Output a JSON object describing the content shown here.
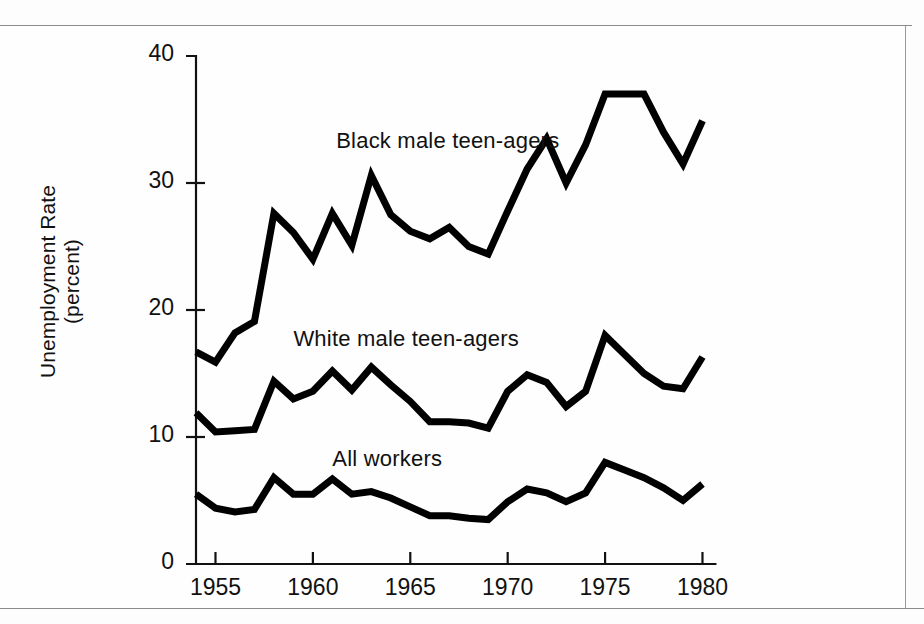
{
  "figure": {
    "ylabel_line1": "Unemployment Rate",
    "ylabel_line2": "(percent)"
  },
  "chart_data": {
    "type": "line",
    "title": "",
    "xlabel": "",
    "ylabel": "Unemployment Rate (percent)",
    "xlim": [
      1954,
      1980
    ],
    "ylim": [
      0,
      40
    ],
    "xticks": [
      1955,
      1960,
      1965,
      1970,
      1975,
      1980
    ],
    "yticks": [
      0,
      10,
      20,
      30,
      40
    ],
    "grid": false,
    "legend": "inline-annotations",
    "x": [
      1954,
      1955,
      1956,
      1957,
      1958,
      1959,
      1960,
      1961,
      1962,
      1963,
      1964,
      1965,
      1966,
      1967,
      1968,
      1969,
      1970,
      1971,
      1972,
      1973,
      1974,
      1975,
      1976,
      1977,
      1978,
      1979,
      1980
    ],
    "series": [
      {
        "name": "Black male teen-agers",
        "label_x": 1961.2,
        "label_y": 33.2,
        "values": [
          16.7,
          15.9,
          18.2,
          19.1,
          27.6,
          26.1,
          24.0,
          27.6,
          25.1,
          30.6,
          27.5,
          26.2,
          25.6,
          26.5,
          25.0,
          24.4,
          27.8,
          31.1,
          33.5,
          30.0,
          33.0,
          37.0,
          37.0,
          37.0,
          34.0,
          31.5,
          34.9
        ]
      },
      {
        "name": "White male teen-agers",
        "label_x": 1959.0,
        "label_y": 17.6,
        "values": [
          11.9,
          10.4,
          10.5,
          10.6,
          14.4,
          13.0,
          13.6,
          15.2,
          13.7,
          15.5,
          14.1,
          12.8,
          11.2,
          11.2,
          11.1,
          10.7,
          13.6,
          14.9,
          14.3,
          12.4,
          13.6,
          18.0,
          16.5,
          15.0,
          14.0,
          13.8,
          16.3
        ]
      },
      {
        "name": "All workers",
        "label_x": 1961.0,
        "label_y": 8.2,
        "values": [
          5.5,
          4.4,
          4.1,
          4.3,
          6.8,
          5.5,
          5.5,
          6.7,
          5.5,
          5.7,
          5.2,
          4.5,
          3.8,
          3.8,
          3.6,
          3.5,
          4.9,
          5.9,
          5.6,
          4.9,
          5.6,
          8.0,
          7.4,
          6.8,
          6.0,
          5.0,
          6.3
        ]
      }
    ]
  }
}
